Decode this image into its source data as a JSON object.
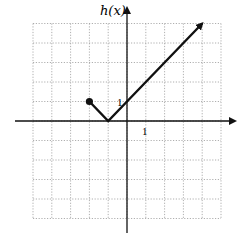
{
  "chart_data": {
    "type": "line",
    "title": "",
    "xlabel": "x",
    "ylabel": "h(x)",
    "xlim": [
      -5,
      5
    ],
    "ylim": [
      -5,
      5
    ],
    "grid": true,
    "grid_style": "dotted",
    "tick_labels": {
      "x": [
        "1"
      ],
      "y": [
        "1"
      ]
    },
    "series": [
      {
        "name": "h(x)",
        "points": [
          [
            -2,
            1
          ],
          [
            -1,
            0
          ],
          [
            0,
            1
          ],
          [
            4,
            5
          ]
        ],
        "start_marker": "closed-dot",
        "end_marker": "arrow"
      }
    ]
  },
  "labels": {
    "y_axis": "h(x)",
    "x_tick_1": "1",
    "y_tick_1": "1"
  },
  "colors": {
    "axis": "#111111",
    "grid": "#9a9a9a",
    "curve": "#111111"
  }
}
